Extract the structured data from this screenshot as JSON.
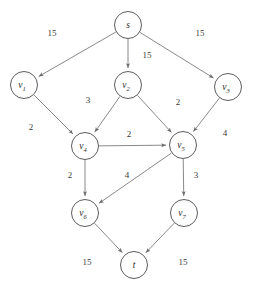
{
  "diagram": {
    "type": "directed-graph",
    "colors": {
      "background": "#ffffff",
      "node_stroke": "#4a4a4a",
      "node_fill": "#ffffff",
      "edge_stroke": "#6b6b6b",
      "label_text": "#2a2a2a"
    },
    "node_radius": 13.5,
    "nodes": [
      {
        "id": "s",
        "base": "s",
        "sub": "",
        "x": 128,
        "y": 25
      },
      {
        "id": "v1",
        "base": "v",
        "sub": "1",
        "x": 24,
        "y": 85
      },
      {
        "id": "v2",
        "base": "v",
        "sub": "2",
        "x": 128,
        "y": 85
      },
      {
        "id": "v3",
        "base": "v",
        "sub": "3",
        "x": 228,
        "y": 87
      },
      {
        "id": "v4",
        "base": "v",
        "sub": "4",
        "x": 85,
        "y": 146
      },
      {
        "id": "v5",
        "base": "v",
        "sub": "5",
        "x": 183,
        "y": 145
      },
      {
        "id": "v6",
        "base": "v",
        "sub": "6",
        "x": 85,
        "y": 213
      },
      {
        "id": "v7",
        "base": "v",
        "sub": "7",
        "x": 184,
        "y": 213
      },
      {
        "id": "t",
        "base": "t",
        "sub": "",
        "x": 134,
        "y": 265
      }
    ],
    "edges": [
      {
        "from": "s",
        "to": "v1",
        "capacity": "15",
        "lx": 52,
        "ly": 33
      },
      {
        "from": "s",
        "to": "v2",
        "capacity": "15",
        "lx": 147,
        "ly": 55
      },
      {
        "from": "s",
        "to": "v3",
        "capacity": "15",
        "lx": 200,
        "ly": 33
      },
      {
        "from": "v1",
        "to": "v4",
        "capacity": "2",
        "lx": 31,
        "ly": 127
      },
      {
        "from": "v2",
        "to": "v4",
        "capacity": "3",
        "lx": 88,
        "ly": 100
      },
      {
        "from": "v2",
        "to": "v5",
        "capacity": "2",
        "lx": 178,
        "ly": 102
      },
      {
        "from": "v3",
        "to": "v5",
        "capacity": "4",
        "lx": 225,
        "ly": 133
      },
      {
        "from": "v4",
        "to": "v5",
        "capacity": "2",
        "lx": 129,
        "ly": 134
      },
      {
        "from": "v4",
        "to": "v6",
        "capacity": "2",
        "lx": 70,
        "ly": 175
      },
      {
        "from": "v5",
        "to": "v6",
        "capacity": "4",
        "lx": 127,
        "ly": 175
      },
      {
        "from": "v5",
        "to": "v7",
        "capacity": "3",
        "lx": 196,
        "ly": 175
      },
      {
        "from": "v6",
        "to": "t",
        "capacity": "15",
        "lx": 87,
        "ly": 262
      },
      {
        "from": "v7",
        "to": "t",
        "capacity": "15",
        "lx": 183,
        "ly": 262
      }
    ]
  }
}
